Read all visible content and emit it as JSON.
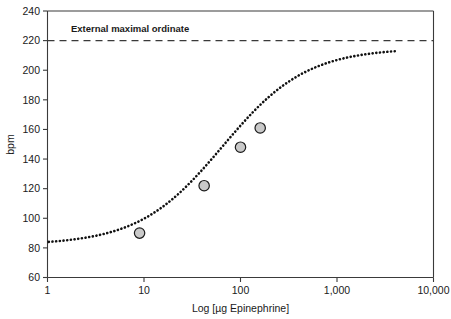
{
  "chart_data": {
    "type": "line",
    "title": "",
    "xlabel": "Log [µg Epinephrine]",
    "ylabel": "bpm",
    "xscale": "log",
    "xlim": [
      1,
      10000
    ],
    "ylim": [
      60,
      240
    ],
    "xticks": [
      1,
      10,
      100,
      1000,
      10000
    ],
    "xticklabels": [
      "1",
      "10",
      "100",
      "1,000",
      "10,000"
    ],
    "yticks": [
      60,
      80,
      100,
      120,
      140,
      160,
      180,
      200,
      220,
      240
    ],
    "yticklabels": [
      "60",
      "80",
      "100",
      "120",
      "140",
      "160",
      "180",
      "200",
      "220",
      "240"
    ],
    "grid": false,
    "legend": "none",
    "series": [
      {
        "name": "Epinephrine dose-response",
        "style": "dotted-sigmoid-curve",
        "baseline_bpm": 82,
        "plateau_bpm": 215,
        "ec50_ug": 65,
        "hill_slope": 1.0,
        "x_start_ug": 1.03,
        "x_end_ug": 4000
      },
      {
        "name": "Measured data points",
        "style": "gray-circle-markers",
        "marker_fill": "#c9c9c9",
        "marker_edge": "#1a1a1a",
        "points": [
          {
            "x": 9,
            "y": 90
          },
          {
            "x": 42,
            "y": 122
          },
          {
            "x": 100,
            "y": 148
          },
          {
            "x": 160,
            "y": 161
          }
        ]
      }
    ],
    "annotations": [
      {
        "type": "hline",
        "label": "External maximal ordinate",
        "y": 220,
        "style": "dashed",
        "label_bold": true
      }
    ]
  },
  "axes": {
    "y_title": "bpm",
    "x_title": "Log [µg Epinephrine]"
  },
  "annotation": {
    "external_max_label": "External maximal ordinate"
  },
  "colors": {
    "axis": "#3a3a3a",
    "curve": "#111111",
    "marker_fill": "#c9c9c9",
    "marker_edge": "#1a1a1a",
    "background": "#ffffff"
  }
}
